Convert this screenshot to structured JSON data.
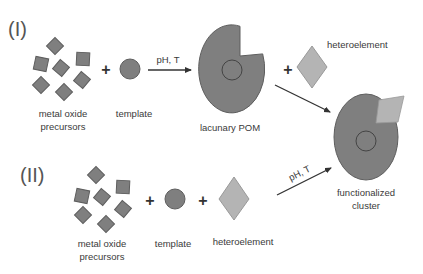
{
  "colors": {
    "precursor_fill": "#7f7f7f",
    "precursor_stroke": "#5e5e5e",
    "heteroelement_fill": "#b4b4b4",
    "heteroelement_stroke": "#999999",
    "arrow": "#333333",
    "text": "#3a3a3a"
  },
  "route_1": {
    "label": "(I)",
    "precursors_label_line1": "metal oxide",
    "precursors_label_line2": "precursors",
    "plus": "+",
    "template_label": "template",
    "arrow_condition": "pH, T",
    "intermediate_label": "lacunary POM",
    "heteroelement_label": "heteroelement"
  },
  "route_2": {
    "label": "(II)",
    "precursors_label_line1": "metal oxide",
    "precursors_label_line2": "precursors",
    "plus": "+",
    "template_label": "template",
    "heteroelement_label": "heteroelement",
    "arrow_condition": "pH, T"
  },
  "product": {
    "label_line1": "functionalized",
    "label_line2": "cluster"
  }
}
